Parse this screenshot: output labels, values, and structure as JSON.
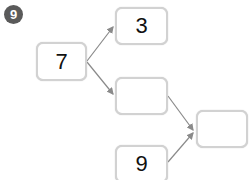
{
  "problem": {
    "number": "9"
  },
  "diagram": {
    "start": {
      "value": "7"
    },
    "top_branch": {
      "value": "3"
    },
    "middle_blank": {
      "value": ""
    },
    "bottom_given": {
      "value": "9"
    },
    "result_blank": {
      "value": ""
    }
  },
  "colors": {
    "badge": "#5a5a5a",
    "box_border": "#d2d2d2",
    "arrow": "#8a8a8a"
  }
}
